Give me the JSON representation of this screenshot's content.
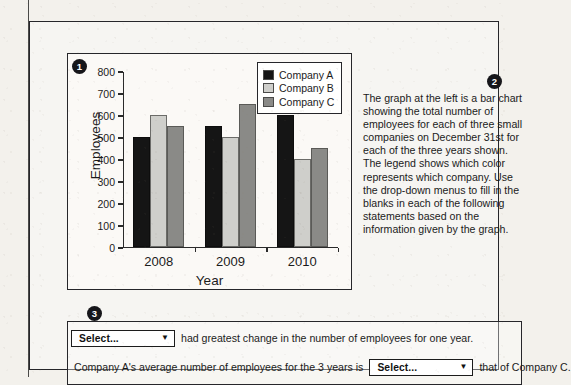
{
  "badges": {
    "one": "1",
    "two": "2",
    "three": "3"
  },
  "chart_data": {
    "type": "bar",
    "title": "",
    "categories": [
      "2008",
      "2009",
      "2010"
    ],
    "series": [
      {
        "name": "Company A",
        "color": "#151515",
        "values": [
          500,
          550,
          600
        ]
      },
      {
        "name": "Company B",
        "color": "#cfcfcb",
        "values": [
          600,
          500,
          400
        ]
      },
      {
        "name": "Company C",
        "color": "#8a8a87",
        "values": [
          550,
          650,
          450
        ]
      }
    ],
    "xlabel": "Year",
    "ylabel": "Employees",
    "ylim": [
      0,
      800
    ],
    "yticks": [
      "0",
      "100",
      "200",
      "300",
      "400",
      "500",
      "600",
      "700",
      "800"
    ],
    "grid": false,
    "legend_position": "top-right"
  },
  "legend": {
    "entries": [
      {
        "label": "Company A",
        "color": "#151515"
      },
      {
        "label": "Company B",
        "color": "#cfcfcb"
      },
      {
        "label": "Company C",
        "color": "#8a8a87"
      }
    ]
  },
  "description": {
    "text": "The graph at the left is a bar chart showing the total number of employees for each of three small companies on December 31st for each of the three years shown. The legend shows which color represents which company. Use the drop-down menus to fill in the blanks in each of the following statements based on the information given by the graph."
  },
  "statements": {
    "row1": {
      "dropdown_value": "Select...",
      "dropdown_arrow": "▼",
      "text_after": "had greatest change in the number of employees for one year."
    },
    "row2": {
      "text_before": "Company A's average number of employees for the 3 years is",
      "dropdown_value": "Select...",
      "dropdown_arrow": "▼",
      "text_after": "that of Company C."
    }
  }
}
